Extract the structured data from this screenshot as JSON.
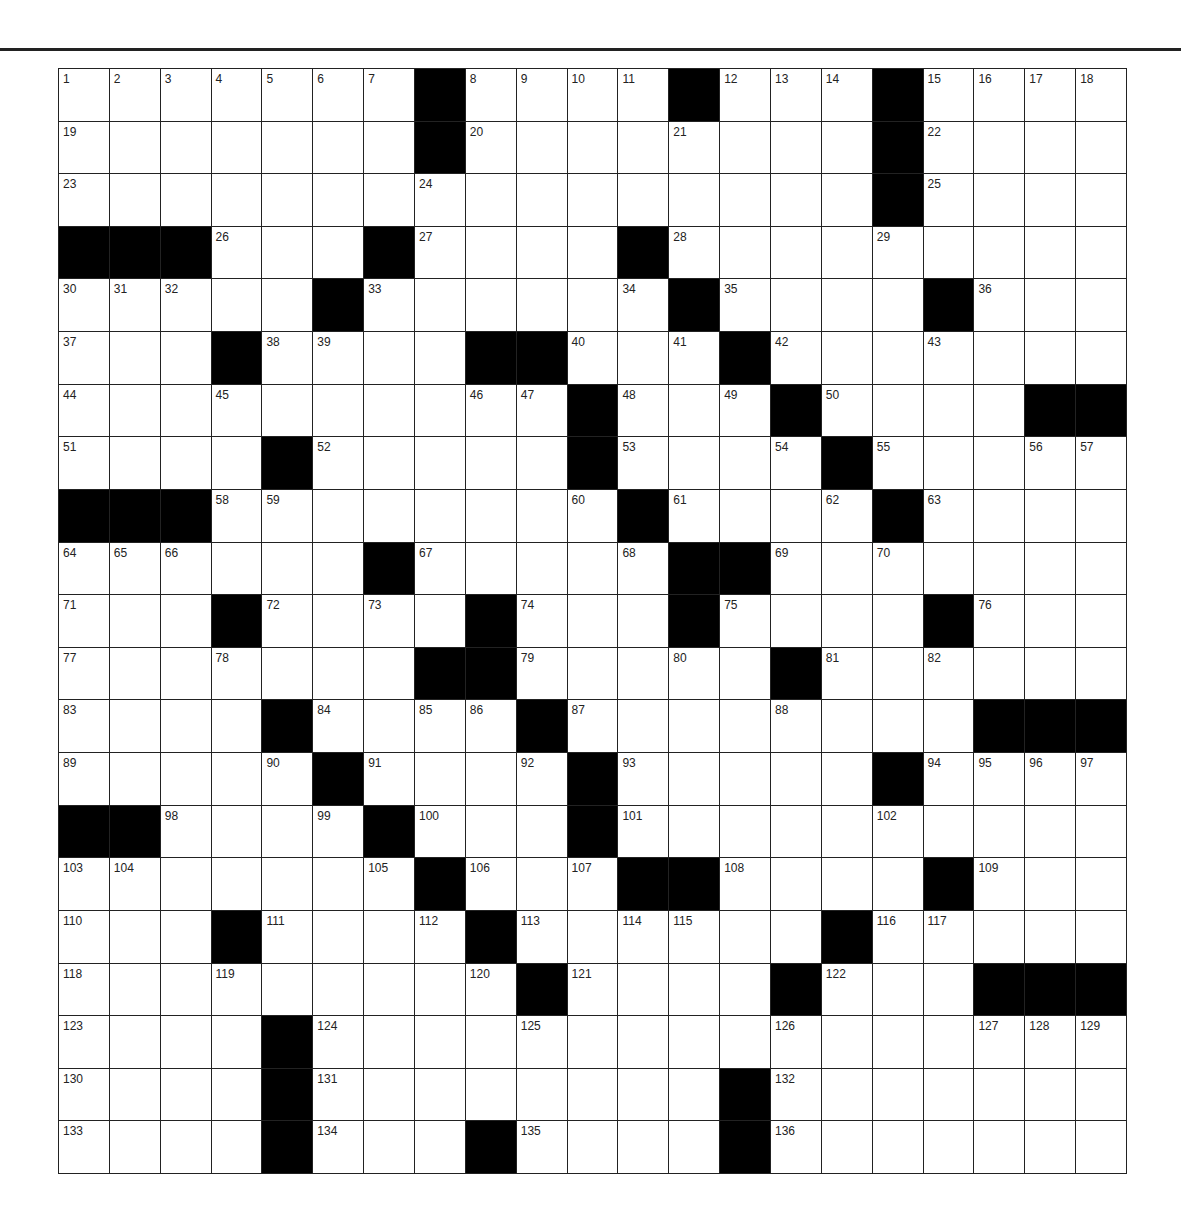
{
  "puzzle": {
    "rows": 21,
    "cols": 21,
    "colors": {
      "line": "#222222",
      "block": "#000000",
      "cell": "#ffffff",
      "number": "#222222"
    },
    "legend": "Each row: space-separated tokens; '#' = black square, '.' = empty white square, number = white square with clue number",
    "grid": [
      "1 2 3 4 5 6 7 # 8 9 10 11 # 12 13 14 # 15 16 17 18",
      "19 . . . . . . # 20 . . . 21 . . . # 22 . . .",
      "23 . . . . . . 24 . . . . . . . . # 25 . . .",
      "# # # 26 . . # 27 . . . # 28 . . . 29 . . . .",
      "30 31 32 . . # 33 . . . . 34 # 35 . . . # 36 . .",
      "37 . . # 38 39 . . # # 40 . 41 # 42 . . 43 . . .",
      "44 . . 45 . . . . 46 47 # 48 . 49 # 50 . . . # #",
      "51 . . . # 52 . . . . # 53 . . 54 # 55 . . 56 57",
      "# # # 58 59 . . . . . 60 # 61 . . 62 # 63 . . .",
      "64 65 66 . . . # 67 . . . 68 # # 69 . 70 . . . .",
      "71 . . # 72 . 73 . # 74 . . # 75 . . . # 76 . .",
      "77 . . 78 . . . # # 79 . . 80 . # 81 . 82 . . .",
      "83 . . . # 84 . 85 86 # 87 . . . 88 . . . # # #",
      "89 . . . 90 # 91 . . 92 # 93 . . . . # 94 95 96 97",
      "# # 98 . . 99 # 100 . . # 101 . . . . 102 . . . .",
      "103 104 . . . . 105 # 106 . 107 # # 108 . . . # 109 . .",
      "110 . . # 111 . . 112 # 113 . 114 115 . . # 116 117 . . .",
      "118 . . 119 . . . . 120 # 121 . . . # 122 . . # # #",
      "123 . . . # 124 . . . 125 . . . . 126 . . . 127 128 129",
      "130 . . . # 131 . . . . . . . # 132 . . . . . .",
      "133 . . . # 134 . . # 135 . . . # 136 . . . . . ."
    ]
  }
}
